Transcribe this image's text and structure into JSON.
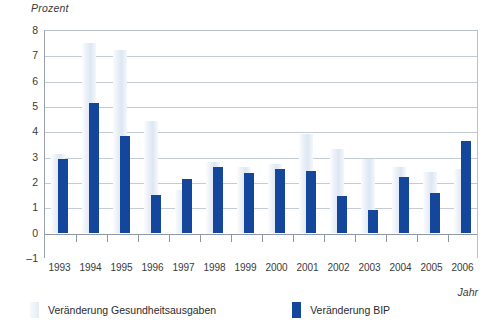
{
  "chart_data": {
    "type": "bar",
    "title": "",
    "xlabel": "Jahr",
    "ylabel": "Prozent",
    "ylim": [
      -1,
      8
    ],
    "yticks": [
      -1,
      0,
      1,
      2,
      3,
      4,
      5,
      6,
      7,
      8
    ],
    "grid": true,
    "legend_position": "bottom-left",
    "categories": [
      "1993",
      "1994",
      "1995",
      "1996",
      "1997",
      "1998",
      "1999",
      "2000",
      "2001",
      "2002",
      "2003",
      "2004",
      "2005",
      "2006"
    ],
    "series": [
      {
        "name": "Veränderung Gesundheitsausgaben",
        "color": "#e4ecf6",
        "values": [
          3.1,
          7.5,
          7.2,
          4.4,
          1.7,
          2.8,
          2.6,
          2.7,
          3.9,
          3.3,
          2.9,
          2.6,
          2.4,
          2.5
        ]
      },
      {
        "name": "Veränderung BIP",
        "color": "#14479b",
        "values": [
          2.9,
          5.1,
          3.8,
          1.5,
          2.1,
          2.6,
          2.35,
          2.5,
          2.45,
          1.45,
          0.9,
          2.2,
          1.55,
          3.6
        ]
      }
    ]
  },
  "axes": {
    "y_unit": "Prozent",
    "x_unit": "Jahr"
  },
  "legend": {
    "items": [
      {
        "label": "Veränderung Gesundheitsausgaben",
        "swatch": "light-blue-swatch"
      },
      {
        "label": "Veränderung BIP",
        "swatch": "dark-blue-swatch"
      }
    ]
  }
}
